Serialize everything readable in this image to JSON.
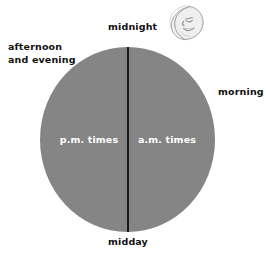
{
  "diagram": {
    "disc": {
      "fill_color": "#858585",
      "divider_color": "#1a1a1a",
      "background_color": "#ffffff"
    },
    "inner_labels": {
      "pm": "p.m. times",
      "am": "a.m. times",
      "text_color": "#ffffff"
    },
    "outer_labels": {
      "midnight": "midnight",
      "afternoon_and_evening": "afternoon\nand evening",
      "morning": "morning",
      "midday": "midday",
      "text_color": "#111111"
    },
    "icons": {
      "moon": "crescent-moon-with-face",
      "moon_color": "#f2f2f2",
      "moon_outline_color": "#9a9a9a"
    }
  }
}
